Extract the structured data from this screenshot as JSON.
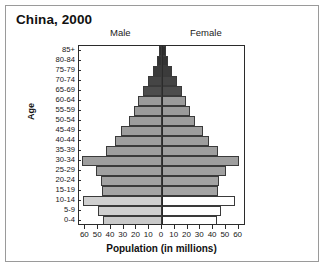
{
  "figure": {
    "title": "China, 2000",
    "male_label": "Male",
    "female_label": "Female",
    "xaxis_title": "Population (in millions)",
    "yaxis_title": "Age",
    "frame_color": "#2b2b2b",
    "bar_outline_color": "#3a3a3a"
  },
  "chart_data": {
    "type": "bar",
    "subtype": "population-pyramid",
    "title": "China, 2000",
    "xlabel": "Population (in millions)",
    "ylabel": "Age",
    "xlim": [
      -65,
      65
    ],
    "xticks": [
      60,
      50,
      40,
      30,
      20,
      10,
      0,
      10,
      20,
      30,
      40,
      50,
      60
    ],
    "grid": false,
    "legend": "none",
    "orientation": "horizontal",
    "categories": [
      "85+",
      "80-84",
      "75-79",
      "70-74",
      "65-69",
      "60-64",
      "55-59",
      "50-54",
      "45-49",
      "40-44",
      "35-39",
      "30-34",
      "25-29",
      "20-24",
      "15-19",
      "10-14",
      "5-9",
      "0-4"
    ],
    "series": [
      {
        "name": "Male",
        "side": "left",
        "values": [
          2,
          4,
          7,
          11,
          15,
          19,
          22,
          26,
          32,
          37,
          44,
          63,
          52,
          48,
          47,
          62,
          50,
          46
        ]
      },
      {
        "name": "Female",
        "side": "right",
        "values": [
          3,
          5,
          8,
          12,
          16,
          19,
          22,
          26,
          32,
          37,
          44,
          60,
          50,
          45,
          44,
          57,
          46,
          43
        ]
      }
    ],
    "bar_colors": [
      "#2e2e2e",
      "#333333",
      "#3b3b3b",
      "#454545",
      "#4d4d4d",
      "#9b9b9b",
      "#9b9b9b",
      "#9d9d9d",
      "#9d9d9d",
      "#9e9e9e",
      "#9e9e9e",
      "#9e9e9e",
      "#a0a0a0",
      "#a2a2a2",
      "#a4a4a4",
      "#cfcfcf",
      "#cfcfcf",
      "#c9c9c9"
    ],
    "female_bar_colors": [
      "#2e2e2e",
      "#333333",
      "#3b3b3b",
      "#454545",
      "#4d4d4d",
      "#9b9b9b",
      "#9b9b9b",
      "#9d9d9d",
      "#9d9d9d",
      "#9e9e9e",
      "#9e9e9e",
      "#9e9e9e",
      "#a0a0a0",
      "#a2a2a2",
      "#a4a4a4",
      "#ffffff",
      "#ffffff",
      "#ffffff"
    ]
  }
}
